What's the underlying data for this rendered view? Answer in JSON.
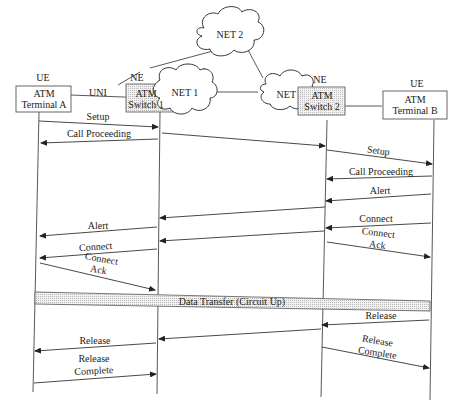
{
  "diagram": {
    "type": "message-sequence-chart",
    "entities": [
      {
        "id": "terminal_a",
        "role": "UE",
        "line1": "ATM",
        "line2": "Terminal A"
      },
      {
        "id": "switch_1",
        "role": "NE",
        "line1": "ATM",
        "line2": "Switch 1"
      },
      {
        "id": "switch_2",
        "role": "NE",
        "line1": "ATM",
        "line2": "Switch 2"
      },
      {
        "id": "terminal_b",
        "role": "UE",
        "line1": "ATM",
        "line2": "Terminal B"
      }
    ],
    "clouds": {
      "net1": "NET 1",
      "net2": "NET 2",
      "net3": "NET 3"
    },
    "interface_label": "UNI",
    "messages": [
      {
        "label": "Setup",
        "from": "terminal_a",
        "to": "switch_1"
      },
      {
        "label": "Call Proceeding",
        "from": "switch_1",
        "to": "terminal_a"
      },
      {
        "label": "",
        "from": "switch_1",
        "to": "switch_2"
      },
      {
        "label": "Setup",
        "from": "switch_2",
        "to": "terminal_b"
      },
      {
        "label": "Call Proceeding",
        "from": "terminal_b",
        "to": "switch_2"
      },
      {
        "label": "Alert",
        "from": "terminal_b",
        "to": "switch_2"
      },
      {
        "label": "",
        "from": "switch_2",
        "to": "switch_1"
      },
      {
        "label": "Alert",
        "from": "switch_1",
        "to": "terminal_a"
      },
      {
        "label": "Connect",
        "from": "terminal_b",
        "to": "switch_2"
      },
      {
        "label": "",
        "from": "switch_2",
        "to": "switch_1"
      },
      {
        "label": "Connect",
        "from": "switch_1",
        "to": "terminal_a"
      },
      {
        "label": "Connect Ack",
        "line1": "Connect",
        "line2": "Ack",
        "from": "switch_2",
        "to": "terminal_b"
      },
      {
        "label": "Connect Ack",
        "line1": "Connect",
        "line2": "Ack",
        "from": "terminal_a",
        "to": "switch_1"
      },
      {
        "label": "Release",
        "from": "terminal_b",
        "to": "switch_2"
      },
      {
        "label": "",
        "from": "switch_2",
        "to": "switch_1"
      },
      {
        "label": "Release",
        "from": "switch_1",
        "to": "terminal_a"
      },
      {
        "label": "Release Complete",
        "line1": "Release",
        "line2": "Complete",
        "from": "switch_2",
        "to": "terminal_b"
      },
      {
        "label": "Release Complete",
        "line1": "Release",
        "line2": "Complete",
        "from": "terminal_a",
        "to": "switch_1"
      }
    ],
    "data_transfer_label": "Data Transfer (Circuit Up)"
  }
}
